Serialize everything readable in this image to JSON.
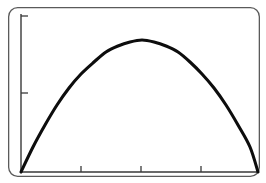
{
  "figure": {
    "title": "",
    "background_color": "#ffffff",
    "frame": {
      "name": "plot-frame",
      "x": 8,
      "y": 7,
      "width": 252,
      "height": 170,
      "corner_radius": 9,
      "stroke_color": "#5a5a5a",
      "stroke_width": 1.3
    },
    "axes": {
      "color": "#3a3a3a",
      "stroke_width": 1.4,
      "x_axis_y": 172,
      "y_axis_x": 21,
      "y_axis_top": 14,
      "x_axis_right": 259
    },
    "ticks": {
      "y_axis": [
        {
          "label": "",
          "y": 16,
          "length": 7
        },
        {
          "label": "",
          "y": 93,
          "length": 7
        }
      ],
      "x_axis": [
        {
          "label": "",
          "x": 81,
          "length": 6
        },
        {
          "label": "",
          "x": 141,
          "length": 6
        },
        {
          "label": "",
          "x": 201,
          "length": 6
        }
      ]
    }
  },
  "chart_data": {
    "type": "line",
    "title": "",
    "subtitle": "",
    "xlabel": "",
    "ylabel": "",
    "grid": false,
    "legend": null,
    "legend_position": "none",
    "series": [
      {
        "name": "parabola",
        "color": "#0d0d0d",
        "line_width": 3.1,
        "description": "Downward-opening parabolic arc rising from the lower-left corner to a rounded peak near the horizontal center, then falling to the lower-right corner.",
        "x": [
          0.0,
          0.05,
          0.1,
          0.15,
          0.2,
          0.25,
          0.3,
          0.35,
          0.4,
          0.45,
          0.5,
          0.55,
          0.6,
          0.65,
          0.7,
          0.75,
          0.8,
          0.85,
          0.9,
          0.95,
          1.0
        ],
        "y": [
          0.0,
          0.19,
          0.36,
          0.51,
          0.64,
          0.75,
          0.84,
          0.91,
          0.96,
          0.99,
          1.0,
          0.99,
          0.96,
          0.91,
          0.84,
          0.75,
          0.64,
          0.51,
          0.36,
          0.19,
          0.0
        ],
        "pixel_points": [
          [
            21,
            172
          ],
          [
            33,
            147
          ],
          [
            45,
            125
          ],
          [
            57,
            105
          ],
          [
            69,
            88
          ],
          [
            81,
            74
          ],
          [
            94,
            62
          ],
          [
            106,
            52
          ],
          [
            118,
            46
          ],
          [
            130,
            42
          ],
          [
            142,
            40
          ],
          [
            154,
            42
          ],
          [
            166,
            46
          ],
          [
            178,
            52
          ],
          [
            190,
            62
          ],
          [
            202,
            74
          ],
          [
            214,
            88
          ],
          [
            226,
            105
          ],
          [
            238,
            125
          ],
          [
            250,
            147
          ],
          [
            258,
            172
          ]
        ],
        "peak_pixel": [
          142,
          40
        ],
        "left_endpoint_pixel": [
          21,
          172
        ],
        "right_endpoint_pixel": [
          258,
          172
        ]
      }
    ],
    "xlim": [
      0.0,
      1.0
    ],
    "ylim": [
      0.0,
      1.0
    ]
  },
  "accessibility": {
    "alt_text": "Line chart showing a smooth downward-opening parabola peaking at the center of the plot area."
  }
}
